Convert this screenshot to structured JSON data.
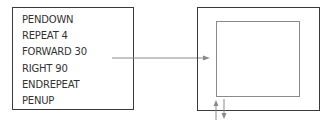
{
  "program": {
    "lines": [
      "PENDOWN",
      "REPEAT 4",
      "FORWARD 30",
      "RIGHT 90",
      "ENDREPEAT",
      "PENUP"
    ]
  },
  "colors": {
    "box_border": "#3a3a3a",
    "square": "#8a8a8a",
    "arrow": "#8a8a8a"
  }
}
